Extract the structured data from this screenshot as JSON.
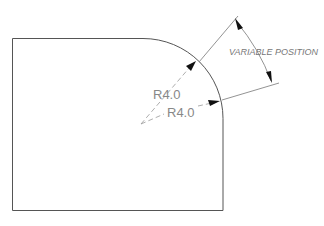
{
  "drawing": {
    "type": "technical-drawing",
    "part": {
      "shape": "rectangle-with-rounded-corner",
      "corner": "top-right"
    },
    "dimensions": [
      {
        "label": "R4.0",
        "kind": "radius"
      },
      {
        "label": "R4.0",
        "kind": "radius"
      }
    ],
    "annotation": {
      "label": "VARIABLE POSITION"
    }
  }
}
